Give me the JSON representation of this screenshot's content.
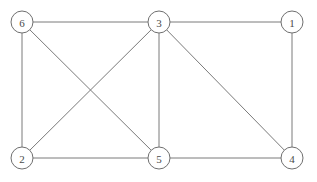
{
  "diagram": {
    "background_color": "#ffffff",
    "edge_color": "#7a7a7a",
    "node_fill_color": "#ffffff",
    "node_stroke_color": "#6f6f6f",
    "label_color": "#4a4a4a",
    "node_radius": 11
  },
  "graph_data": {
    "type": "node-link-diagram",
    "directed": false,
    "node_count": 6,
    "edge_count": 10,
    "nodes": [
      {
        "id": "6",
        "label": "6",
        "x": 22,
        "y": 22,
        "position": "top-left"
      },
      {
        "id": "3",
        "label": "3",
        "x": 159,
        "y": 22,
        "position": "top-center"
      },
      {
        "id": "1",
        "label": "1",
        "x": 292,
        "y": 22,
        "position": "top-right"
      },
      {
        "id": "2",
        "label": "2",
        "x": 22,
        "y": 158,
        "position": "bottom-left"
      },
      {
        "id": "5",
        "label": "5",
        "x": 159,
        "y": 158,
        "position": "bottom-center"
      },
      {
        "id": "4",
        "label": "4",
        "x": 292,
        "y": 158,
        "position": "bottom-right"
      }
    ],
    "edges": [
      {
        "source": "6",
        "target": "3",
        "kind": "horizontal-top"
      },
      {
        "source": "3",
        "target": "1",
        "kind": "horizontal-top"
      },
      {
        "source": "2",
        "target": "5",
        "kind": "horizontal-bottom"
      },
      {
        "source": "5",
        "target": "4",
        "kind": "horizontal-bottom"
      },
      {
        "source": "6",
        "target": "2",
        "kind": "vertical-left"
      },
      {
        "source": "3",
        "target": "5",
        "kind": "vertical-center"
      },
      {
        "source": "1",
        "target": "4",
        "kind": "vertical-right"
      },
      {
        "source": "6",
        "target": "5",
        "kind": "diagonal-crossing"
      },
      {
        "source": "3",
        "target": "2",
        "kind": "diagonal-crossing"
      },
      {
        "source": "3",
        "target": "4",
        "kind": "diagonal"
      }
    ]
  }
}
